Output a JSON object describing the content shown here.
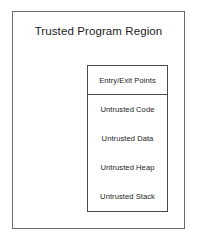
{
  "diagram": {
    "outer_region": {
      "title": "Trusted Program Region",
      "border_color": "#6b6b6b",
      "fill_color": "#ffffff"
    },
    "inner_module": {
      "border_color": "#4a4a4a",
      "fill_color": "#ffffff",
      "rows": [
        {
          "label": "Entry/Exit Points",
          "divider_below": true
        },
        {
          "label": "Untrusted Code",
          "divider_below": false
        },
        {
          "label": "Untrusted Data",
          "divider_below": false
        },
        {
          "label": "Untrusted Heap",
          "divider_below": false
        },
        {
          "label": "Untrusted Stack",
          "divider_below": false
        }
      ]
    }
  }
}
